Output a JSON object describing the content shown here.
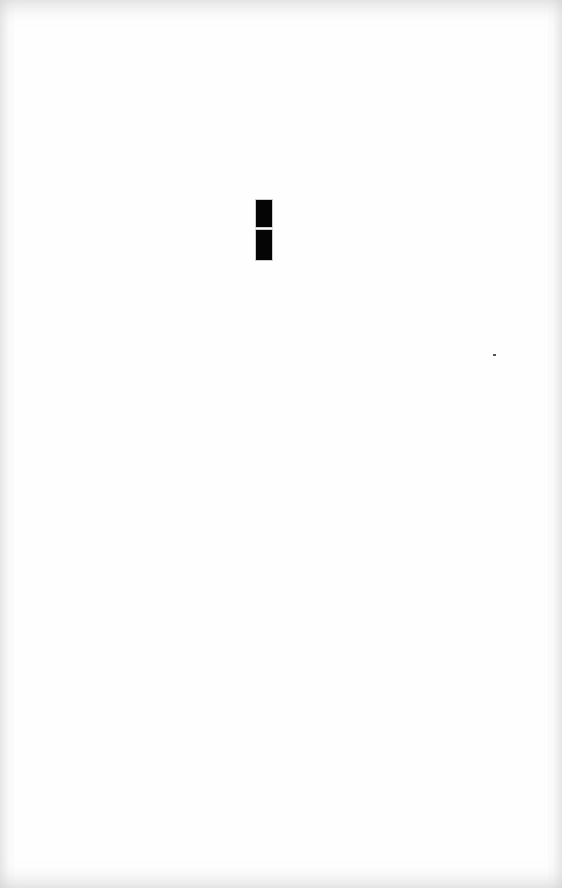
{
  "document": {
    "background_color": "#fefefe",
    "marks": [
      {
        "name": "black-block-upper",
        "x": 256,
        "y": 200,
        "width": 16,
        "height": 27,
        "color": "#050505"
      },
      {
        "name": "black-block-lower",
        "x": 256,
        "y": 230,
        "width": 16,
        "height": 30,
        "color": "#050505"
      }
    ],
    "specks": [
      {
        "name": "stray-speck",
        "x": 493,
        "y": 354,
        "width": 3,
        "height": 2,
        "color": "#555555"
      }
    ]
  }
}
